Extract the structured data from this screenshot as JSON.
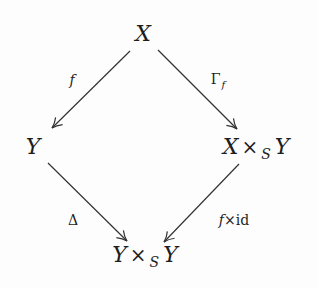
{
  "diagram": {
    "type": "commutative-diagram",
    "colors": {
      "background": "#fdfdfd",
      "ink": "#1e1e1e",
      "arrow": "#333333"
    },
    "nodes": {
      "top": {
        "base": "X",
        "x": 143,
        "y": 34
      },
      "left": {
        "base": "Y",
        "x": 33,
        "y": 147
      },
      "right": {
        "left": "X",
        "op": "×",
        "sub": "S",
        "right": "Y",
        "x": 256,
        "y": 147
      },
      "bottom": {
        "left": "Y",
        "op": "×",
        "sub": "S",
        "right": "Y",
        "x": 145,
        "y": 255
      }
    },
    "arrows": [
      {
        "id": "f",
        "from": "top",
        "to": "left",
        "x1": 130,
        "y1": 51,
        "x2": 52,
        "y2": 128
      },
      {
        "id": "gamma_f",
        "from": "top",
        "to": "right",
        "x1": 158,
        "y1": 50,
        "x2": 237,
        "y2": 129
      },
      {
        "id": "delta",
        "from": "left",
        "to": "bottom",
        "x1": 48,
        "y1": 163,
        "x2": 127,
        "y2": 241
      },
      {
        "id": "f_times_id",
        "from": "right",
        "to": "bottom",
        "x1": 239,
        "y1": 164,
        "x2": 164,
        "y2": 242
      }
    ],
    "labels": {
      "f": {
        "text": "f",
        "x": 72,
        "y": 80
      },
      "gamma_f": {
        "base": "Γ",
        "sub": "f",
        "x": 218,
        "y": 79
      },
      "delta": {
        "text": "Δ",
        "x": 73,
        "y": 220
      },
      "f_times_id": {
        "f": "f",
        "op": "×",
        "id": "id",
        "x": 234,
        "y": 220
      }
    }
  }
}
